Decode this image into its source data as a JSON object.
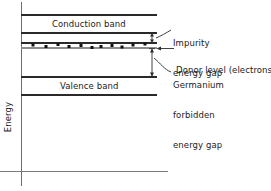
{
  "figure": {
    "type": "energy-band-diagram",
    "width": 271,
    "height": 191,
    "background_color": "#ffffff",
    "line_color": "#1a1a1a",
    "gray_line_color": "#8c8c8c",
    "text_color": "#1a1a1a"
  },
  "axes": {
    "y_label": "Energy",
    "y_axis_x": 21,
    "y_axis_top": 2,
    "y_axis_bottom": 186,
    "x_axis_y": 171,
    "x_axis_left": 0,
    "x_axis_right": 168
  },
  "bands": [
    {
      "name": "conduction-band",
      "label": "Conduction band",
      "top_y": 15,
      "bottom_y": 33,
      "left_x": 21,
      "right_x": 157
    },
    {
      "name": "valence-band",
      "label": "Valence band",
      "top_y": 77,
      "bottom_y": 95,
      "left_x": 21,
      "right_x": 157
    }
  ],
  "donor_level": {
    "name": "donor-level",
    "upper_line_y": 43,
    "lower_line_y": 48,
    "left_x": 21,
    "right_x": 157,
    "electron_dots": [
      {
        "x": 33,
        "y": 45
      },
      {
        "x": 46,
        "y": 46
      },
      {
        "x": 58,
        "y": 44
      },
      {
        "x": 69,
        "y": 46
      },
      {
        "x": 81,
        "y": 45
      },
      {
        "x": 92,
        "y": 47
      },
      {
        "x": 101,
        "y": 46
      },
      {
        "x": 112,
        "y": 45
      },
      {
        "x": 122,
        "y": 47
      },
      {
        "x": 133,
        "y": 45
      },
      {
        "x": 145,
        "y": 44
      }
    ]
  },
  "gap_arrows": [
    {
      "name": "impurity-energy-gap-arrow",
      "x": 152,
      "top_y": 33,
      "bottom_y": 43
    },
    {
      "name": "germanium-forbidden-energy-gap-arrow",
      "x": 152,
      "top_y": 48,
      "bottom_y": 77
    }
  ],
  "annotations": [
    {
      "name": "impurity-energy-gap",
      "lines": [
        "Impurity",
        "energy gap"
      ],
      "text_x": 173,
      "text_y": 18,
      "leader": {
        "from_x": 171,
        "from_y": 31,
        "to_x": 156,
        "to_y": 38
      }
    },
    {
      "name": "donor-level",
      "lines": [
        "Donor level (electrons)"
      ],
      "text_x": 176,
      "text_y": 45,
      "leader": {
        "from_x": 174,
        "from_y": 49,
        "to_x": 157,
        "to_y": 46
      }
    },
    {
      "name": "germanium-forbidden-energy-gap",
      "lines": [
        "Germanium",
        "forbidden",
        "energy gap"
      ],
      "text_x": 173,
      "text_y": 60,
      "leader": {
        "from_x": 171,
        "from_y": 73,
        "to_x": 154,
        "to_y": 58
      }
    }
  ]
}
